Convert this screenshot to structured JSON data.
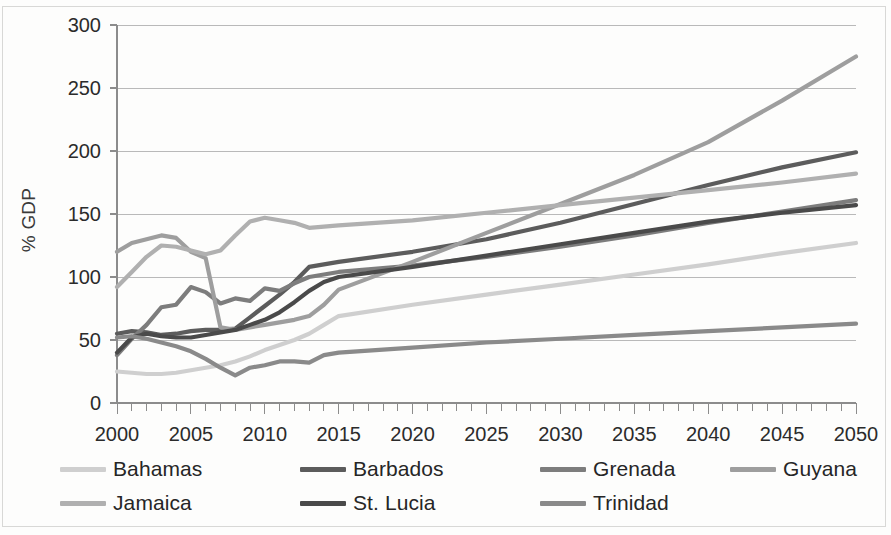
{
  "chart_data": {
    "type": "line",
    "title": "",
    "xlabel": "",
    "ylabel": "% GDP",
    "xlim": [
      2000,
      2050
    ],
    "ylim": [
      0,
      300
    ],
    "x_tick_labels": [
      "2000",
      "2005",
      "2010",
      "2015",
      "2020",
      "2025",
      "2030",
      "2035",
      "2040",
      "2045",
      "2050"
    ],
    "x_tick_values": [
      2000,
      2005,
      2010,
      2015,
      2020,
      2025,
      2030,
      2035,
      2040,
      2045,
      2050
    ],
    "x_minor_tick_step": 1,
    "y_tick_labels": [
      "0",
      "50",
      "100",
      "150",
      "200",
      "250",
      "300"
    ],
    "y_tick_values": [
      0,
      50,
      100,
      150,
      200,
      250,
      300
    ],
    "grid": "horizontal",
    "legend_position": "bottom",
    "series": [
      {
        "name": "Bahamas",
        "color": "#cfcfcf",
        "x": [
          2000,
          2001,
          2002,
          2003,
          2004,
          2005,
          2006,
          2007,
          2008,
          2009,
          2010,
          2011,
          2012,
          2013,
          2014,
          2015,
          2020,
          2025,
          2030,
          2035,
          2040,
          2045,
          2050
        ],
        "values": [
          25,
          24,
          23,
          23,
          24,
          26,
          28,
          30,
          33,
          37,
          42,
          46,
          50,
          55,
          62,
          69,
          78,
          86,
          94,
          102,
          110,
          119,
          127
        ]
      },
      {
        "name": "Barbados",
        "color": "#5c5c5c",
        "x": [
          2000,
          2001,
          2002,
          2003,
          2004,
          2005,
          2006,
          2007,
          2008,
          2009,
          2010,
          2011,
          2012,
          2013,
          2014,
          2015,
          2020,
          2025,
          2030,
          2035,
          2040,
          2045,
          2050
        ],
        "values": [
          55,
          57,
          56,
          54,
          55,
          57,
          58,
          58,
          59,
          68,
          77,
          86,
          96,
          108,
          110,
          112,
          120,
          130,
          143,
          158,
          173,
          187,
          199
        ]
      },
      {
        "name": "Grenada",
        "color": "#7d7d7d",
        "x": [
          2000,
          2001,
          2002,
          2003,
          2004,
          2005,
          2006,
          2007,
          2008,
          2009,
          2010,
          2011,
          2012,
          2013,
          2014,
          2015,
          2020,
          2025,
          2030,
          2035,
          2040,
          2045,
          2050
        ],
        "values": [
          38,
          51,
          62,
          76,
          78,
          92,
          88,
          79,
          83,
          81,
          91,
          89,
          95,
          100,
          102,
          104,
          109,
          116,
          124,
          133,
          143,
          152,
          161
        ]
      },
      {
        "name": "Guyana",
        "color": "#9e9e9e",
        "x": [
          2000,
          2001,
          2002,
          2003,
          2004,
          2005,
          2006,
          2007,
          2008,
          2009,
          2010,
          2011,
          2012,
          2013,
          2014,
          2015,
          2020,
          2025,
          2030,
          2035,
          2040,
          2045,
          2050
        ],
        "values": [
          120,
          127,
          130,
          133,
          131,
          120,
          115,
          60,
          58,
          60,
          62,
          64,
          66,
          69,
          78,
          90,
          112,
          135,
          158,
          181,
          207,
          240,
          275
        ]
      },
      {
        "name": "Jamaica",
        "color": "#b0b0b0",
        "x": [
          2000,
          2001,
          2002,
          2003,
          2004,
          2005,
          2006,
          2007,
          2008,
          2009,
          2010,
          2011,
          2012,
          2013,
          2014,
          2015,
          2020,
          2025,
          2030,
          2035,
          2040,
          2045,
          2050
        ],
        "values": [
          92,
          104,
          116,
          125,
          124,
          121,
          118,
          121,
          133,
          144,
          147,
          145,
          143,
          139,
          140,
          141,
          145,
          151,
          157,
          163,
          169,
          175,
          182
        ]
      },
      {
        "name": "St. Lucia",
        "color": "#4a4a4a",
        "x": [
          2000,
          2001,
          2002,
          2003,
          2004,
          2005,
          2006,
          2007,
          2008,
          2009,
          2010,
          2011,
          2012,
          2013,
          2014,
          2015,
          2020,
          2025,
          2030,
          2035,
          2040,
          2045,
          2050
        ],
        "values": [
          40,
          52,
          55,
          53,
          52,
          52,
          54,
          56,
          58,
          62,
          66,
          72,
          80,
          89,
          96,
          100,
          108,
          117,
          126,
          135,
          144,
          151,
          157
        ]
      },
      {
        "name": "Trinidad",
        "color": "#8a8a8a",
        "x": [
          2000,
          2001,
          2002,
          2003,
          2004,
          2005,
          2006,
          2007,
          2008,
          2009,
          2010,
          2011,
          2012,
          2013,
          2014,
          2015,
          2020,
          2025,
          2030,
          2035,
          2040,
          2045,
          2050
        ],
        "values": [
          52,
          53,
          51,
          48,
          45,
          41,
          35,
          28,
          22,
          28,
          30,
          33,
          33,
          32,
          38,
          40,
          44,
          48,
          51,
          54,
          57,
          60,
          63
        ]
      }
    ]
  },
  "axis": {
    "y_label": "% GDP"
  },
  "legend": {
    "rows": [
      [
        {
          "label": "Bahamas",
          "series": 0
        },
        {
          "label": "Barbados",
          "series": 1
        },
        {
          "label": "Grenada",
          "series": 2
        },
        {
          "label": "Guyana",
          "series": 3
        }
      ],
      [
        {
          "label": "Jamaica",
          "series": 4
        },
        {
          "label": "St. Lucia",
          "series": 5
        },
        {
          "label": "Trinidad",
          "series": 6
        }
      ]
    ]
  }
}
